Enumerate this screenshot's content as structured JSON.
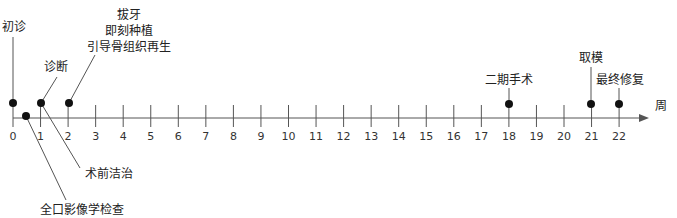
{
  "diagram": {
    "type": "timeline",
    "unit_label": "周",
    "axis": {
      "min": 0,
      "max": 22,
      "ticks": [
        0,
        1,
        2,
        3,
        4,
        5,
        6,
        7,
        8,
        9,
        10,
        11,
        12,
        13,
        14,
        15,
        16,
        17,
        18,
        19,
        20,
        21,
        22
      ]
    },
    "events": [
      {
        "week": 0,
        "label": "初诊"
      },
      {
        "week": 0.5,
        "label": "全口影像学检查"
      },
      {
        "week": 1,
        "label": "诊断"
      },
      {
        "week": 1,
        "label": "术前洁治"
      },
      {
        "week": 2,
        "label_lines": [
          "拔牙",
          "即刻种植",
          "引导骨组织再生"
        ]
      },
      {
        "week": 18,
        "label": "二期手术"
      },
      {
        "week": 21,
        "label": "取模"
      },
      {
        "week": 22,
        "label": "最终修复"
      }
    ],
    "colors": {
      "line": "#555555",
      "dot": "#111111",
      "text": "#222222"
    }
  }
}
